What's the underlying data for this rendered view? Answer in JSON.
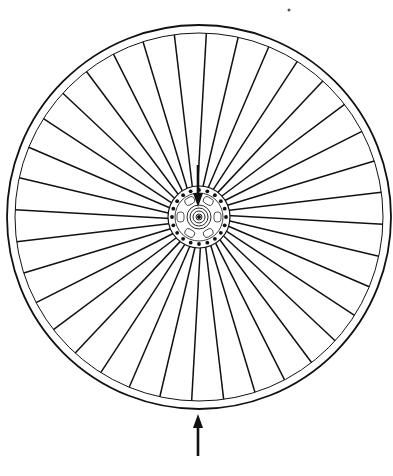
{
  "diagram": {
    "title": "Bicycle wheel with spokes under load",
    "wheel": {
      "center": [
        199,
        217
      ],
      "rim_outer_radius": 192,
      "rim_inner_radius": 184,
      "spoke_count": 36,
      "hub_flange_radius": 31,
      "hub_hole_count": 20,
      "hub_core_rings": [
        3,
        6,
        9,
        12
      ]
    },
    "arrows": [
      {
        "name": "hub-load-arrow",
        "direction": "down",
        "from": [
          198,
          165
        ],
        "to": [
          198,
          207
        ],
        "meaning": "load applied at hub"
      },
      {
        "name": "ground-reaction-arrow",
        "direction": "up",
        "from": [
          198,
          456
        ],
        "to": [
          198,
          414
        ],
        "meaning": "ground reaction force"
      }
    ],
    "colors": {
      "stroke": "#111111",
      "background": "#ffffff"
    }
  }
}
